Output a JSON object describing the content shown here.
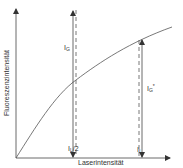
{
  "diagram": {
    "y_axis_label": "Fluoreszenzintensität",
    "x_axis_label": "Laserintensität",
    "labels": {
      "ig": {
        "main": "I",
        "sub": "G",
        "sup": ""
      },
      "ig_star": {
        "main": "I",
        "sub": "G",
        "sup": "*"
      },
      "il_half": {
        "main": "I",
        "sub": "L",
        "tail": "/2"
      },
      "il": {
        "main": "I",
        "sub": "L",
        "tail": ""
      }
    },
    "colors": {
      "line": "#555555",
      "axis": "#444444",
      "text": "#333333"
    }
  }
}
